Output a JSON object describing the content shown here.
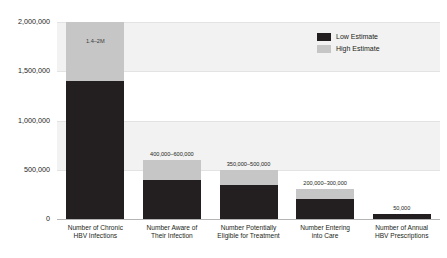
{
  "chart_data": {
    "type": "bar",
    "subtype": "stacked-range-bar",
    "title": "",
    "xlabel": "",
    "ylabel": "",
    "ylim": [
      0,
      2000000
    ],
    "grid": true,
    "legend_position": "top-right",
    "y_ticks": [
      "0",
      "500,000",
      "1,000,000",
      "1,500,000",
      "2,000,000"
    ],
    "y_tick_values": [
      0,
      500000,
      1000000,
      1500000,
      2000000
    ],
    "categories": [
      "Number of Chronic HBV Infections",
      "Number Aware of Their Infection",
      "Number Potentially Eligible for Treatment",
      "Number Entering into Care",
      "Number of Annual HBV Prescriptions"
    ],
    "category_lines": [
      [
        "Number of Chronic",
        "HBV Infections"
      ],
      [
        "Number Aware of",
        "Their Infection"
      ],
      [
        "Number Potentially",
        "Eligible for Treatment"
      ],
      [
        "Number Entering",
        "into Care"
      ],
      [
        "Number of Annual",
        "HBV Prescriptions"
      ]
    ],
    "series": [
      {
        "name": "Low Estimate",
        "color": "#231f20",
        "values": [
          1400000,
          400000,
          350000,
          200000,
          50000
        ]
      },
      {
        "name": "High Estimate",
        "color": "#c6c6c6",
        "values": [
          2000000,
          600000,
          500000,
          300000,
          50000
        ]
      }
    ],
    "value_labels": [
      "1.4–2M",
      "400,000–600,000",
      "350,000–500,000",
      "200,000–300,000",
      "50,000"
    ],
    "label_placement": [
      "inside",
      "above",
      "above",
      "above",
      "above"
    ]
  },
  "legend": {
    "items": [
      {
        "label": "Low Estimate",
        "color": "#231f20"
      },
      {
        "label": "High Estimate",
        "color": "#c6c6c6"
      }
    ]
  },
  "colors": {
    "low_estimate": "#231f20",
    "high_estimate": "#c6c6c6",
    "band": "#f2f2f2",
    "axis": "#b4b4b4",
    "text": "#231f20",
    "background": "#ffffff"
  }
}
